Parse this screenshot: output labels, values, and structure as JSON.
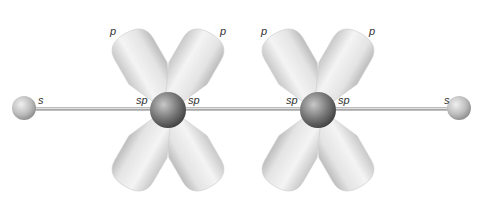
{
  "caption_fragment": "Acetylene bonding: sp hybrid and p orbitals",
  "atoms": [
    {
      "id": "H1",
      "type": "hydrogen",
      "orbital_label": "s"
    },
    {
      "id": "C1",
      "type": "carbon",
      "left_label": "sp",
      "right_label": "sp"
    },
    {
      "id": "C2",
      "type": "carbon",
      "left_label": "sp",
      "right_label": "sp"
    },
    {
      "id": "H2",
      "type": "hydrogen",
      "orbital_label": "s"
    }
  ],
  "p_orbital_labels": [
    "p",
    "p",
    "p",
    "p"
  ],
  "colors": {
    "bond": "#9a9a9a",
    "carbon": "#6e6e6e",
    "hydrogen": "#b8b8b8",
    "lobe": "#e6e6e6"
  }
}
